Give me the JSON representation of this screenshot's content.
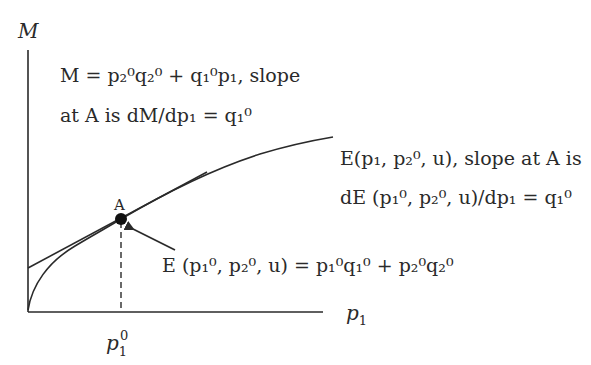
{
  "diagram": {
    "type": "expenditure-function-tangency",
    "axes": {
      "y_label": "M",
      "x_label": "p",
      "x_label_sub": "1"
    },
    "point": {
      "label": "A",
      "x_tick_base": "p",
      "x_tick_sub": "1",
      "x_tick_sup": "0"
    },
    "annotations": {
      "budget_line": {
        "line1": "M = p₂⁰q₂⁰ + q₁⁰p₁, slope",
        "line2": "at A is dM/dp₁ = q₁⁰"
      },
      "expenditure_curve": {
        "line1": "E(p₁, p₂⁰, u), slope at A is",
        "line2": "dE (p₁⁰, p₂⁰, u)/dp₁ = q₁⁰"
      },
      "tangency_point": {
        "text": "E (p₁⁰, p₂⁰, u) = p₁⁰q₁⁰ + p₂⁰q₂⁰"
      }
    },
    "colors": {
      "ink": "#2a2a2a",
      "background": "#ffffff"
    }
  }
}
